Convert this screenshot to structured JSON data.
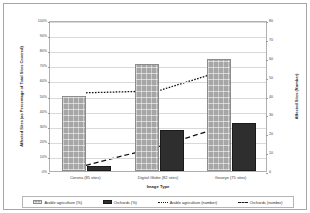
{
  "chart_data": {
    "type": "bar",
    "title": "",
    "xlabel": "Image Type",
    "ylabel": "Affected Sites (as Percentage of Total Sites Covered)",
    "ylabel_right": "Affected Sites (Number)",
    "categories": [
      "Corona (85 sites)",
      "Digital Globe (82 sites)",
      "Geoeye (75 sites)"
    ],
    "ylim": [
      0,
      100
    ],
    "ylim_right": [
      0,
      80
    ],
    "ytick_labels": [
      "0%",
      "10%",
      "20%",
      "30%",
      "40%",
      "50%",
      "60%",
      "70%",
      "80%",
      "90%",
      "100%"
    ],
    "ytick_values": [
      0,
      10,
      20,
      30,
      40,
      50,
      60,
      70,
      80,
      90,
      100
    ],
    "ytick_right_labels": [
      "0",
      "10",
      "20",
      "30",
      "40",
      "50",
      "60",
      "70",
      "80"
    ],
    "ytick_right_values": [
      0,
      10,
      20,
      30,
      40,
      50,
      60,
      70,
      80
    ],
    "grid": true,
    "legend_position": "bottom",
    "series": [
      {
        "name": "Arable agriculture (%)",
        "kind": "bar",
        "axis": "left",
        "values": [
          50,
          71,
          74
        ]
      },
      {
        "name": "Orchards (%)",
        "kind": "bar",
        "axis": "left",
        "values": [
          3,
          27,
          32
        ]
      },
      {
        "name": "Arable agriculture (number)",
        "kind": "line",
        "style": "dotted",
        "axis": "right",
        "values": [
          42,
          43,
          55
        ]
      },
      {
        "name": "Orchards (number)",
        "kind": "line",
        "style": "dashed",
        "axis": "right",
        "values": [
          3,
          13,
          25
        ]
      }
    ]
  },
  "legend": {
    "items": [
      {
        "label": "Arable agriculture (%)",
        "marker": "swatch-hatched-gray"
      },
      {
        "label": "Orchards (%)",
        "marker": "swatch-solid-black"
      },
      {
        "label": "Arable agriculture (number)",
        "marker": "line-dotted"
      },
      {
        "label": "Orchards (number)",
        "marker": "line-dashed"
      }
    ]
  }
}
